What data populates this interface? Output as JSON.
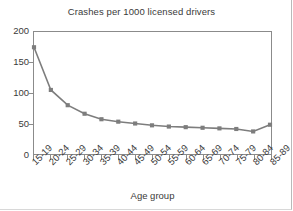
{
  "chart_data": {
    "type": "line",
    "title": "Crashes per 1000 licensed drivers",
    "xlabel": "Age group",
    "ylabel": "",
    "categories": [
      "15-19",
      "20-24",
      "25-29",
      "30-34",
      "35-39",
      "40-44",
      "45-49",
      "50-54",
      "55-59",
      "60-64",
      "65-69",
      "70-74",
      "75-79",
      "80-84",
      "85-89"
    ],
    "values": [
      175,
      105,
      80,
      66,
      57,
      53,
      50,
      47,
      45,
      44,
      43,
      42,
      41,
      37,
      48
    ],
    "ylim": [
      0,
      200
    ],
    "yticks": [
      0,
      50,
      100,
      150,
      200
    ],
    "ytick_labels": [
      "0",
      "50",
      "100",
      "150",
      "200"
    ],
    "grid": false,
    "legend": "none",
    "marker": "square",
    "series_color": "#7d7d7d",
    "axis_color": "#8b8b8b",
    "text_color": "#3a3a3a"
  }
}
